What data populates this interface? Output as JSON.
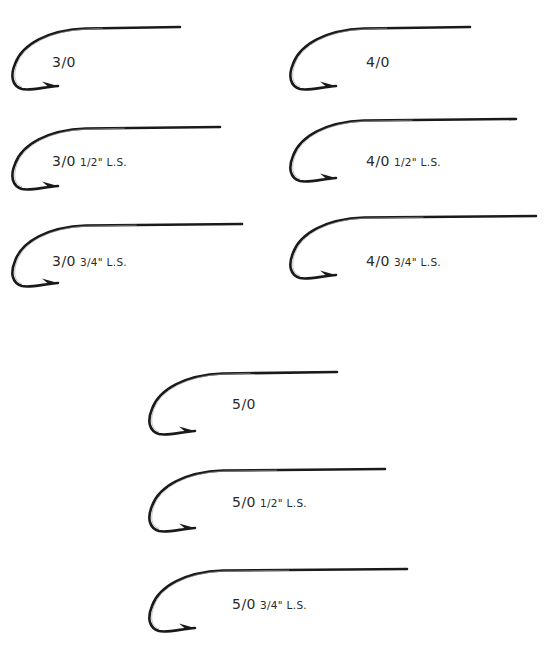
{
  "colors": {
    "ink": "#1a1a1a",
    "label": "#2a2a2a",
    "background": "#ffffff"
  },
  "hooks": [
    {
      "id": "3-0",
      "size": "3/0",
      "shank": "",
      "x": 8,
      "y": 26,
      "len": 172,
      "labelX": 52,
      "labelY": 52
    },
    {
      "id": "4-0",
      "size": "4/0",
      "shank": "",
      "x": 286,
      "y": 26,
      "len": 184,
      "labelX": 366,
      "labelY": 52
    },
    {
      "id": "3-0-12",
      "size": "3/0",
      "shank": "1/2\" L.S.",
      "x": 8,
      "y": 126,
      "len": 212,
      "labelX": 52,
      "labelY": 151
    },
    {
      "id": "4-0-12",
      "size": "4/0",
      "shank": "1/2\" L.S.",
      "x": 286,
      "y": 118,
      "len": 230,
      "labelX": 366,
      "labelY": 151
    },
    {
      "id": "3-0-34",
      "size": "3/0",
      "shank": "3/4\" L.S.",
      "x": 8,
      "y": 223,
      "len": 234,
      "labelX": 52,
      "labelY": 251
    },
    {
      "id": "4-0-34",
      "size": "4/0",
      "shank": "3/4\" L.S.",
      "x": 286,
      "y": 215,
      "len": 250,
      "labelX": 366,
      "labelY": 251
    },
    {
      "id": "5-0",
      "size": "5/0",
      "shank": "",
      "x": 145,
      "y": 371,
      "len": 192,
      "labelX": 232,
      "labelY": 394
    },
    {
      "id": "5-0-12",
      "size": "5/0",
      "shank": "1/2\" L.S.",
      "x": 145,
      "y": 468,
      "len": 240,
      "labelX": 232,
      "labelY": 492
    },
    {
      "id": "5-0-34",
      "size": "5/0",
      "shank": "3/4\" L.S.",
      "x": 145,
      "y": 568,
      "len": 262,
      "labelX": 232,
      "labelY": 594
    }
  ]
}
